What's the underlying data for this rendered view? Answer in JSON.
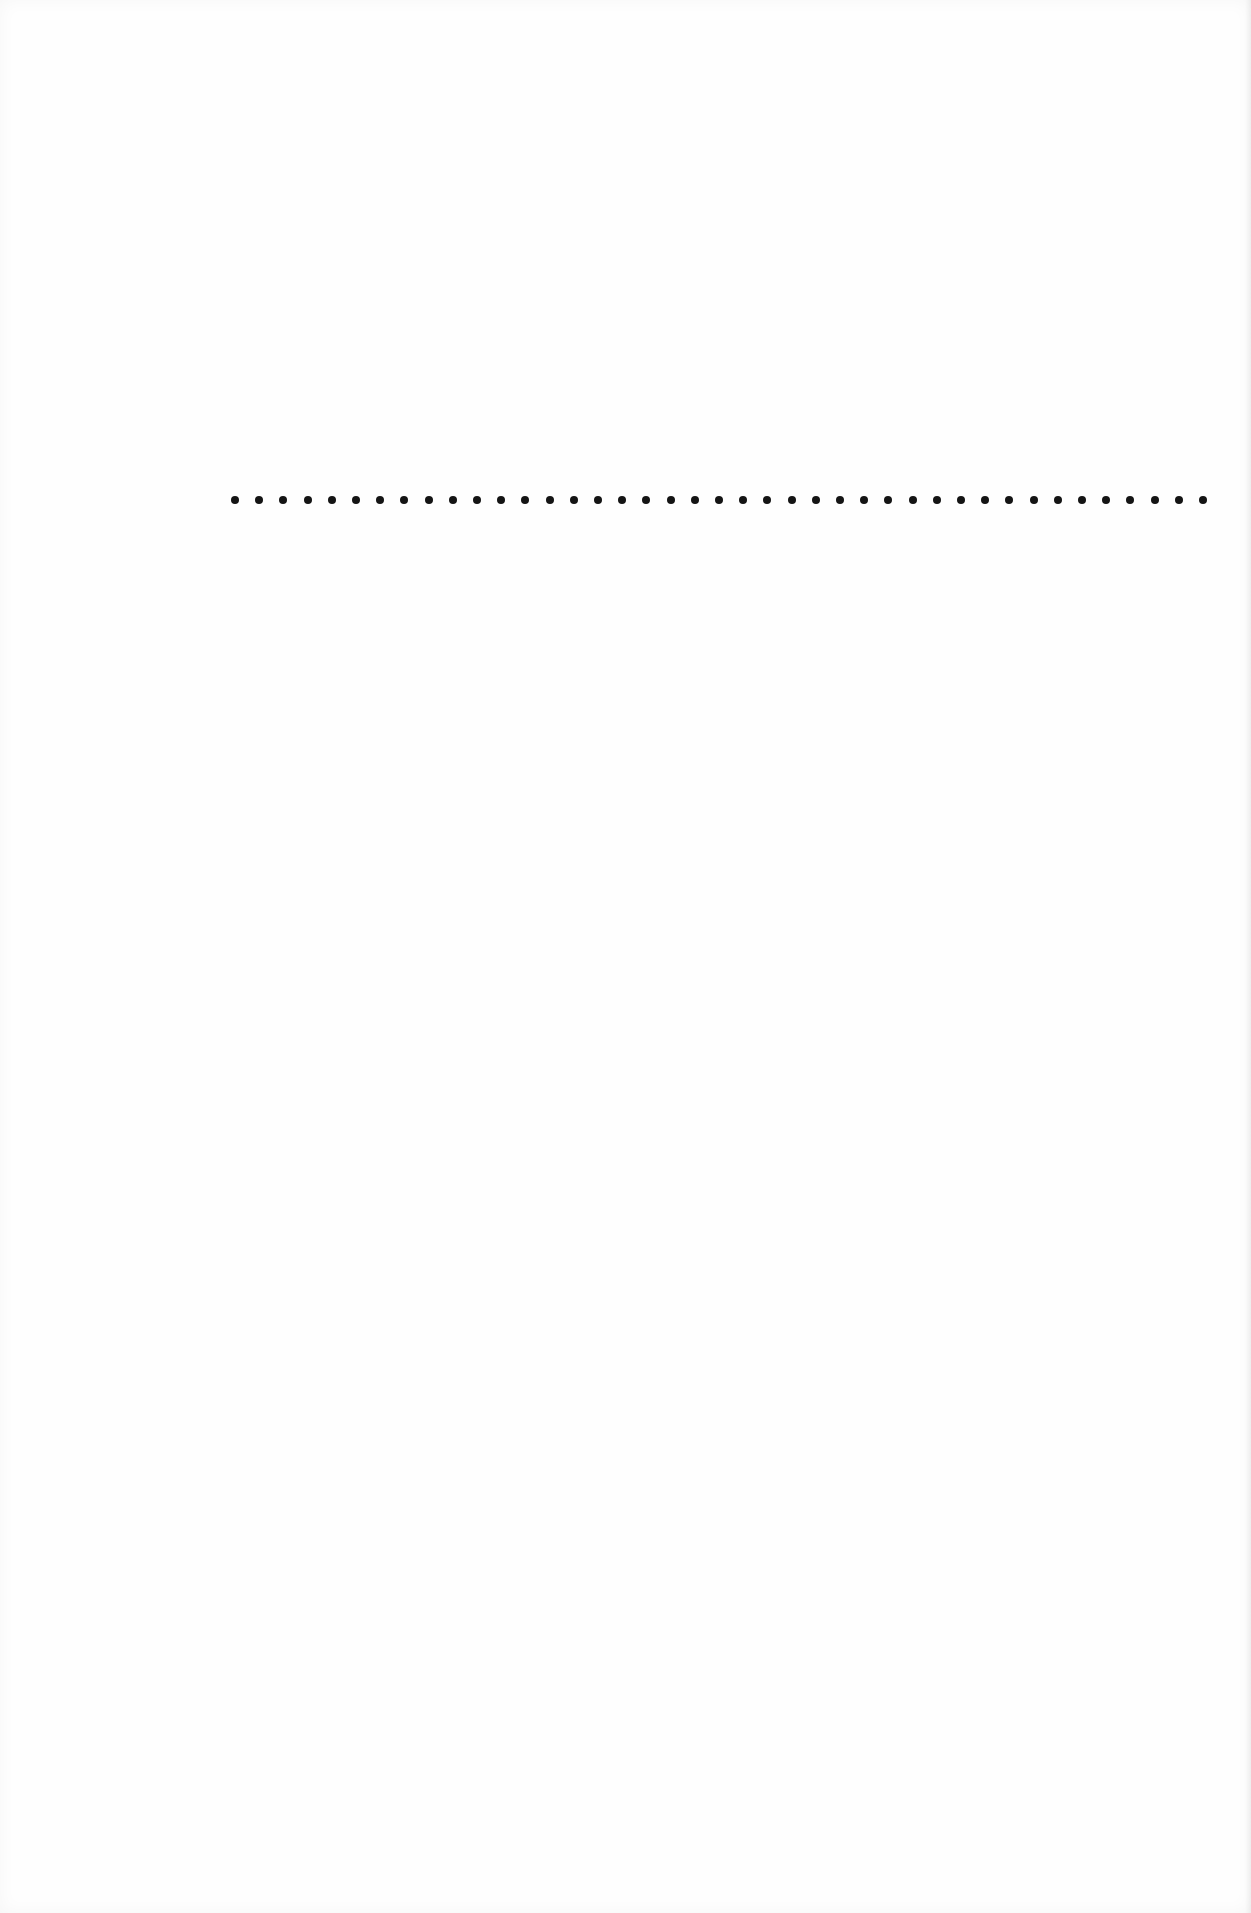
{
  "page": {
    "type": "blank scanned page with dot leader",
    "background": "#fefefe"
  },
  "dot_leader": {
    "count": 41,
    "start_x": 0,
    "spacing": 24.2,
    "diameter": 8,
    "color": "#141414"
  }
}
